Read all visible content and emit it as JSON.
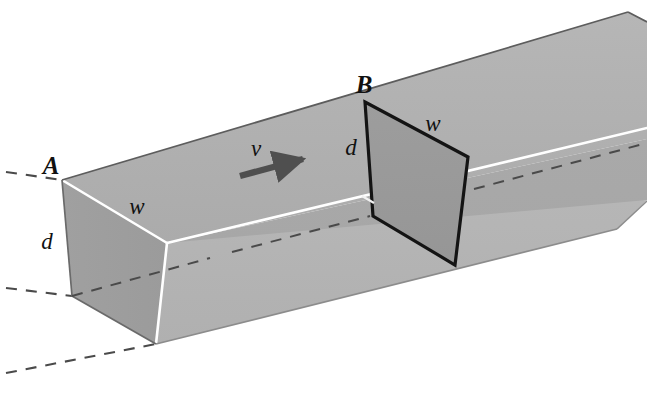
{
  "figure": {
    "background_color": "#ffffff"
  },
  "labels": {
    "point_a": "A",
    "point_b": "B",
    "depth_left": "d",
    "width_left": "w",
    "depth_right": "d",
    "width_right": "w",
    "velocity": "v"
  },
  "colors": {
    "face_top": "#b0b0b0",
    "face_front_upper": "#a8a8a8",
    "face_front_lower": "#b4b4b4",
    "face_end_left": "#9e9e9e",
    "face_end_bottom": "#a2a2a2",
    "cross_section_fill": "#9a9a9a",
    "edge_white": "#ffffff",
    "edge_black": "#141414",
    "edge_dark_outline": "#6a6a6a",
    "dashed_line": "#4a4a4a",
    "arrow": "#4f4f4f",
    "text": "#111111"
  },
  "geometry": {
    "note": "Coordinates in pixels within a 647x399 canvas",
    "vanishing_direction": "right and upward",
    "section_a_position": [
      62,
      180
    ],
    "section_b_position": [
      365,
      102
    ],
    "pipe_extends_off_right_edge": true
  },
  "annotations": {
    "dashed_guide_lines": 3,
    "arrow_direction": "right-and-slightly-up",
    "cross_section_b_outlined": true
  }
}
